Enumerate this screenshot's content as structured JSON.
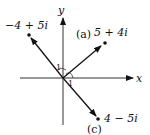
{
  "axes": {
    "x_label": "x",
    "y_label": "y"
  },
  "vectors": [
    {
      "id": "a",
      "tag": "(a)",
      "label": "5 + 4i",
      "re": 5,
      "im": 4
    },
    {
      "id": "b",
      "tag": "",
      "label": "−4 + 5i",
      "re": -4,
      "im": 5
    },
    {
      "id": "c",
      "tag": "(c)",
      "label": "4 − 5i",
      "re": 4,
      "im": -5
    }
  ],
  "unit_marks": [
    "1",
    "1"
  ],
  "colors": {
    "ink": "#111111",
    "background": "#ffffff"
  }
}
